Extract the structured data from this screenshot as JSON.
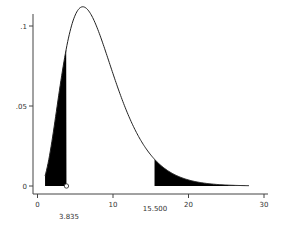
{
  "chart_data": {
    "type": "line",
    "title": "",
    "xlabel": "",
    "ylabel": "",
    "x_ticks": [
      "0",
      "10",
      "20",
      "30"
    ],
    "y_ticks": [
      "0",
      ".05",
      ".1"
    ],
    "xlim": [
      0,
      30
    ],
    "ylim": [
      0,
      0.11
    ],
    "curve": {
      "distribution": "chi-square",
      "df": 8,
      "x_range": [
        1,
        28
      ],
      "peak_x": 6,
      "peak_y": 0.104
    },
    "shaded_regions": [
      {
        "name": "lower-tail",
        "from": 1,
        "to": 3.835
      },
      {
        "name": "upper-tail",
        "from": 15.5,
        "to": 28
      }
    ],
    "annotations": [
      "3.835",
      "15.500"
    ],
    "marker": {
      "x": 3.835,
      "y": 0,
      "shape": "hollow-circle"
    },
    "grid": false,
    "legend": null
  }
}
